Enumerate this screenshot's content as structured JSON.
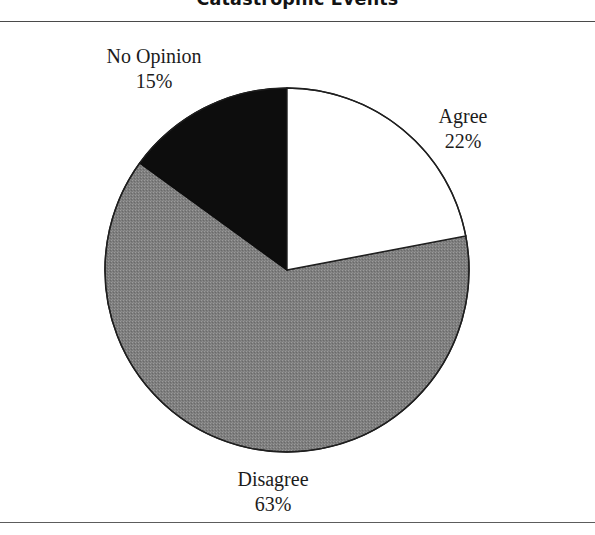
{
  "figure": {
    "title": "Catastrophic Events"
  },
  "chart_data": {
    "type": "pie",
    "title": "Catastrophic Events",
    "xlabel": "",
    "ylabel": "",
    "grid": false,
    "legend": "none",
    "label_placement": "outside-callout",
    "start_angle_deg": 0,
    "direction": "clockwise",
    "units": "percent",
    "categories": [
      "Agree",
      "Disagree",
      "No Opinion"
    ],
    "values": [
      22,
      63,
      15
    ],
    "slices": [
      {
        "name": "Agree",
        "label": "Agree",
        "value": 22,
        "value_label": "22%",
        "color": "#ffffff",
        "stroke": "#1a1a1a",
        "start_deg": 0,
        "end_deg": 79.2
      },
      {
        "name": "Disagree",
        "label": "Disagree",
        "value": 63,
        "value_label": "63%",
        "color": "#808080",
        "stroke": "#1a1a1a",
        "start_deg": 79.2,
        "end_deg": 306.0
      },
      {
        "name": "No Opinion",
        "label": "No Opinion",
        "value": 15,
        "value_label": "15%",
        "color": "#0d0d0d",
        "stroke": "#0d0d0d",
        "start_deg": 306.0,
        "end_deg": 360.0
      }
    ],
    "geometry": {
      "center_x": 287,
      "center_y": 270,
      "radius": 182
    }
  },
  "labels": {
    "no_opinion": {
      "name": "No Opinion",
      "percent": "15%"
    },
    "agree": {
      "name": "Agree",
      "percent": "22%"
    },
    "disagree": {
      "name": "Disagree",
      "percent": "63%"
    }
  },
  "colors": {
    "agree_fill": "#ffffff",
    "disagree_fill": "#808080",
    "no_opinion_fill": "#0d0d0d",
    "outline": "#1a1a1a",
    "rule": "#4a4a4a",
    "text": "#1c1c1c"
  }
}
